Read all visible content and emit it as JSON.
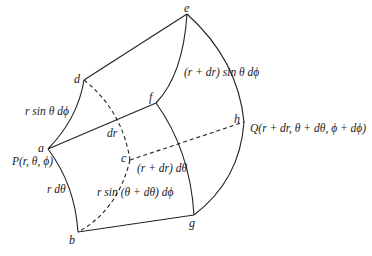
{
  "diagram": {
    "type": "spherical-volume-element",
    "points": {
      "a": "a",
      "b": "b",
      "c": "c",
      "d": "d",
      "e": "e",
      "f": "f",
      "g": "g",
      "h": "h"
    },
    "labels": {
      "P": "P(r, θ, ϕ)",
      "Q": "Q(r + dr, θ + dθ, ϕ + dϕ)",
      "ad": "r sin θ dϕ",
      "ab": "r dθ",
      "dr": "dr",
      "ef": "(r + dr) sin θ dϕ",
      "fg": "(r + dr) dθ",
      "bc": "r sin (θ + dθ) dϕ"
    }
  }
}
